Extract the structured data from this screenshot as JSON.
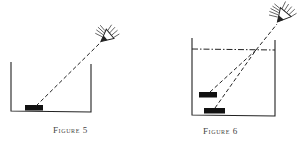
{
  "figures": [
    {
      "id": "figure-5",
      "caption": "Figure 5",
      "description": "Eye looking at a coin on the bottom of an empty container along a straight dashed line of sight",
      "elements": [
        "container",
        "coin",
        "line-of-sight",
        "eye"
      ]
    },
    {
      "id": "figure-6",
      "caption": "Figure 6",
      "description": "Container filled with water; line of sight bends at the water surface so the coin appears raised (apparent image above real coin)",
      "elements": [
        "container",
        "water-surface",
        "real-coin",
        "apparent-coin",
        "refracted-line-of-sight",
        "eye"
      ]
    }
  ],
  "colors": {
    "ink": "#222222",
    "coin": "#111111",
    "caption": "#444444",
    "background": "#ffffff"
  }
}
